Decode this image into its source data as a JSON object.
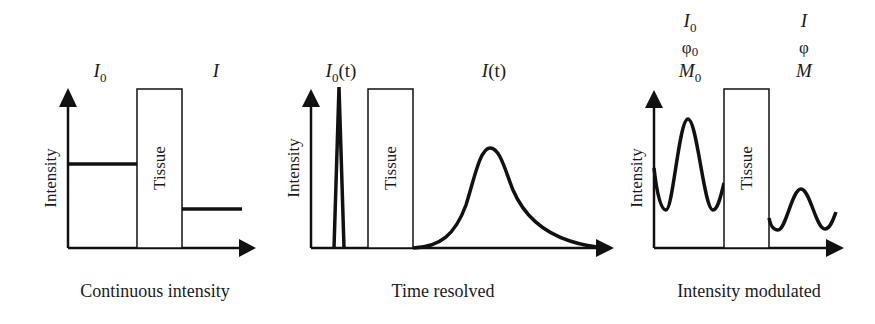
{
  "figure": {
    "panels": [
      {
        "id": "continuous",
        "caption": "Continuous intensity",
        "y_axis_label": "Intensity",
        "tissue_label": "Tissue",
        "input_label": {
          "main": "I",
          "sub": "0"
        },
        "output_label": {
          "main": "I",
          "sub": ""
        },
        "input_level": "high constant line",
        "output_level": "low constant line"
      },
      {
        "id": "time-resolved",
        "caption": "Time resolved",
        "y_axis_label": "Intensity",
        "tissue_label": "Tissue",
        "input_label": {
          "main": "I",
          "sub": "0",
          "arg": "(t)"
        },
        "output_label": {
          "main": "I",
          "sub": "",
          "arg": "(t)"
        },
        "input_shape": "narrow pulse",
        "output_shape": "broadened delayed pulse"
      },
      {
        "id": "intensity-modulated",
        "caption": "Intensity modulated",
        "y_axis_label": "Intensity",
        "tissue_label": "Tissue",
        "input_labels": [
          {
            "main": "I",
            "sub": "0"
          },
          {
            "main": "φ",
            "sub": "0"
          },
          {
            "main": "M",
            "sub": "0"
          }
        ],
        "output_labels": [
          {
            "main": "I",
            "sub": ""
          },
          {
            "main": "φ",
            "sub": ""
          },
          {
            "main": "M",
            "sub": ""
          }
        ],
        "input_shape": "high-amplitude sinusoid",
        "output_shape": "attenuated phase-shifted sinusoid"
      }
    ],
    "colors": {
      "line": "#111111",
      "text": "#1a1a1a",
      "background": "#ffffff"
    }
  }
}
